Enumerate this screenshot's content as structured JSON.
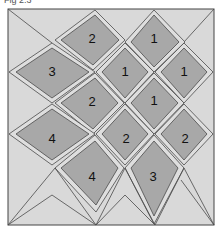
{
  "caption": "Fig 2.3",
  "colors": {
    "background": "#d9d9d9",
    "frame": "#444444",
    "diamond_fill": "#a8a8a8",
    "diamond_border": "#dedede",
    "outline": "#4a4a4a"
  },
  "diamonds": [
    {
      "label": "2",
      "cx": 92,
      "cy": 40
    },
    {
      "label": "1",
      "cx": 154,
      "cy": 40
    },
    {
      "label": "3",
      "cx": 52,
      "cy": 73
    },
    {
      "label": "1",
      "cx": 125,
      "cy": 73
    },
    {
      "label": "1",
      "cx": 184,
      "cy": 73
    },
    {
      "label": "2",
      "cx": 92,
      "cy": 103
    },
    {
      "label": "1",
      "cx": 154,
      "cy": 102
    },
    {
      "label": "4",
      "cx": 52,
      "cy": 140
    },
    {
      "label": "2",
      "cx": 126,
      "cy": 140
    },
    {
      "label": "2",
      "cx": 185,
      "cy": 140
    },
    {
      "label": "4",
      "cx": 92,
      "cy": 178
    },
    {
      "label": "3",
      "cx": 153,
      "cy": 178
    }
  ]
}
